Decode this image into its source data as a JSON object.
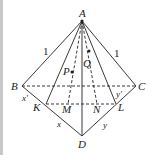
{
  "figure": {
    "points": {
      "A": {
        "label": "A",
        "x": 82,
        "y": 21
      },
      "B": {
        "label": "B",
        "x": 22,
        "y": 86
      },
      "C": {
        "label": "C",
        "x": 136,
        "y": 86
      },
      "D": {
        "label": "D",
        "x": 82,
        "y": 136
      },
      "K": {
        "label": "K",
        "x": 46,
        "y": 104
      },
      "M": {
        "label": "M",
        "x": 68,
        "y": 104
      },
      "N": {
        "label": "N",
        "x": 97,
        "y": 104
      },
      "L": {
        "label": "L",
        "x": 116,
        "y": 104
      },
      "P": {
        "label": "P",
        "x": 72,
        "y": 72
      },
      "Q": {
        "label": "Q",
        "x": 89,
        "y": 51
      }
    },
    "edge_labels": {
      "AB": "1",
      "AC": "1",
      "BK": "x'",
      "KD": "x",
      "CL": "y'",
      "LD": "y"
    },
    "line_color": "#222222"
  }
}
